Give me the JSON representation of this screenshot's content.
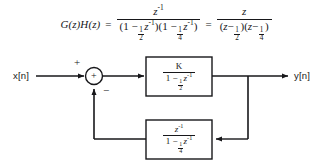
{
  "equation": {
    "lhs": "G(z)H(z)",
    "equals_1": "=",
    "equals_2": "=",
    "frac1": {
      "numerator": "z",
      "numerator_exponent": "-1",
      "denominator_parts": [
        {
          "open": "(1 ",
          "minus": "−",
          "frac_num": "1",
          "frac_den": "2",
          "var": "z",
          "exp": "-1",
          "close": ")"
        },
        {
          "open": "(1 ",
          "minus": "−",
          "frac_num": "1",
          "frac_den": "4",
          "var": "z",
          "exp": "-1",
          "close": ")"
        }
      ]
    },
    "frac2": {
      "numerator": "z",
      "denominator_parts": [
        {
          "open": "(",
          "var": "z",
          "minus": "−",
          "frac_num": "1",
          "frac_den": "2",
          "close": ")"
        },
        {
          "open": "(",
          "var": "z",
          "minus": "−",
          "frac_num": "1",
          "frac_den": "4",
          "close": ")"
        }
      ]
    }
  },
  "diagram": {
    "input_label": "x[n]",
    "output_label": "y[n]",
    "summing_junction": {
      "inside_sign": "+",
      "input_sign": "+",
      "feedback_sign": "−"
    },
    "forward_block": {
      "numerator": "K",
      "denominator": {
        "lead": "1 ",
        "minus": "−",
        "frac_num": "1",
        "frac_den": "2",
        "var": "z",
        "exp": "-1"
      }
    },
    "feedback_block": {
      "numerator": {
        "var": "z",
        "exp": "-1"
      },
      "denominator": {
        "lead": "1 ",
        "minus": "−",
        "frac_num": "1",
        "frac_den": "4",
        "var": "z",
        "exp": "-1"
      }
    }
  },
  "colors": {
    "line": "#17171a",
    "background": "#ffffff",
    "text": "#17171a"
  }
}
